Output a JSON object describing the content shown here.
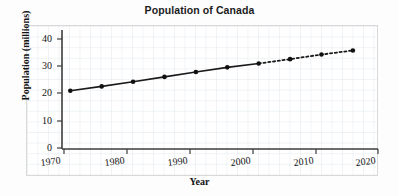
{
  "chart_data": {
    "type": "line",
    "title": "Population of Canada",
    "xlabel": "Year",
    "ylabel": "Population (millions)",
    "xlim": [
      1970,
      2020
    ],
    "ylim": [
      0,
      44
    ],
    "xticks": [
      "1970",
      "1980",
      "1990",
      "2000",
      "2010",
      "2020"
    ],
    "xtick_values": [
      1970,
      1980,
      1990,
      2000,
      2010,
      2020
    ],
    "yticks": [
      "0",
      "10",
      "20",
      "30",
      "40"
    ],
    "ytick_values": [
      0,
      10,
      20,
      30,
      40
    ],
    "grid": "minor graph-paper grid, light blue-grey",
    "legend": "none",
    "marker": "filled circle",
    "series": [
      {
        "name": "Population of Canada",
        "style": "solid line with markers (observed)",
        "x": [
          1971,
          1976,
          1981,
          1986,
          1991,
          1996,
          2001
        ],
        "values": [
          21.0,
          22.6,
          24.3,
          26.1,
          27.9,
          29.6,
          31.0
        ]
      },
      {
        "name": "Population of Canada (projected)",
        "style": "dotted line with markers (projected)",
        "x": [
          2001,
          2006,
          2011,
          2016
        ],
        "values": [
          31.0,
          32.6,
          34.3,
          35.8
        ]
      }
    ],
    "points": [
      {
        "year": 1971,
        "population": 21.0,
        "segment": "observed"
      },
      {
        "year": 1976,
        "population": 22.6,
        "segment": "observed"
      },
      {
        "year": 1981,
        "population": 24.3,
        "segment": "observed"
      },
      {
        "year": 1986,
        "population": 26.1,
        "segment": "observed"
      },
      {
        "year": 1991,
        "population": 27.9,
        "segment": "observed"
      },
      {
        "year": 1996,
        "population": 29.6,
        "segment": "observed"
      },
      {
        "year": 2001,
        "population": 31.0,
        "segment": "observed"
      },
      {
        "year": 2006,
        "population": 32.6,
        "segment": "projected"
      },
      {
        "year": 2011,
        "population": 34.3,
        "segment": "projected"
      },
      {
        "year": 2016,
        "population": 35.8,
        "segment": "projected"
      }
    ],
    "colors": {
      "line": "#1a1a1a",
      "marker": "#111111",
      "axis": "#444444",
      "grid": "#dbe3ea",
      "background": "#ffffff",
      "text": "#131313"
    }
  }
}
